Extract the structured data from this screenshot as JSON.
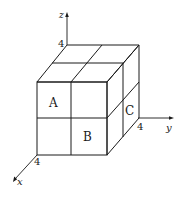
{
  "diagram": {
    "type": "3d-cube-coordinate-diagram",
    "axes": {
      "x": {
        "label": "x",
        "tick": "4"
      },
      "y": {
        "label": "y",
        "tick": "4"
      },
      "z": {
        "label": "z",
        "tick": "4"
      }
    },
    "regions": {
      "A": "A",
      "B": "B",
      "C": "C"
    },
    "colors": {
      "line": "#1a1a1a",
      "background": "#ffffff"
    }
  }
}
